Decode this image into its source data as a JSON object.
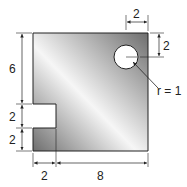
{
  "diagram": {
    "type": "engineering-dimension-drawing",
    "shape": "square plate with rectangular notch and circular hole",
    "dimensions": {
      "height_top_segment": "6",
      "notch_height": "2",
      "bottom_segment": "2",
      "notch_width": "2",
      "remaining_width": "8",
      "hole_offset_right": "2",
      "hole_offset_top": "2",
      "hole_radius_label": "r = 1"
    },
    "colors": {
      "plate_dark": "#6e6e6e",
      "plate_light": "#f4f4f4",
      "line": "#222222"
    }
  }
}
